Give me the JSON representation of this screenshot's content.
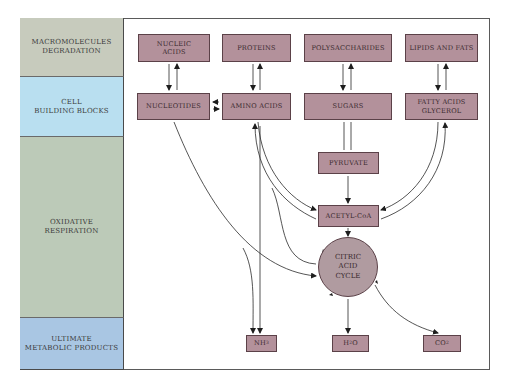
{
  "stages": [
    {
      "id": "macromolecules",
      "label": "MACROMOLECULES\nDEGRADATION",
      "color": "#c7cbbd"
    },
    {
      "id": "building-blocks",
      "label": "CELL\nBUILDING BLOCKS",
      "color": "#b9dff0"
    },
    {
      "id": "oxidative",
      "label": "OXIDATIVE\nRESPIRATION",
      "color": "#bccab8"
    },
    {
      "id": "products",
      "label": "ULTIMATE\nMETABOLIC PRODUCTS",
      "color": "#a9c6e3"
    }
  ],
  "macromolecules": [
    {
      "label": "NUCLEIC\nACIDS"
    },
    {
      "label": "PROTEINS"
    },
    {
      "label": "POLYSACCHARIDES"
    },
    {
      "label": "LIPIDS AND FATS"
    }
  ],
  "building_blocks": [
    {
      "label": "NUCLEOTIDES"
    },
    {
      "label": "AMINO ACIDS"
    },
    {
      "label": "SUGARS"
    },
    {
      "label": "FATTY ACIDS\nGLYCEROL"
    }
  ],
  "intermediates": {
    "pyruvate": "PYRUVATE",
    "acetyl_coa": "ACETYL-CoA",
    "citric_acid_cycle": "CITRIC\nACID\nCYCLE"
  },
  "products": {
    "nh3": {
      "base": "NH",
      "sub": "3"
    },
    "h2o": {
      "base": "H",
      "sub": "2",
      "rest": "O"
    },
    "co2": {
      "base": "CO",
      "sub": "2"
    }
  },
  "colors": {
    "box_fill": "#b3919b",
    "box_border": "#5b4148",
    "circle_fill": "#b09ba0",
    "line": "#2a2a2a"
  }
}
